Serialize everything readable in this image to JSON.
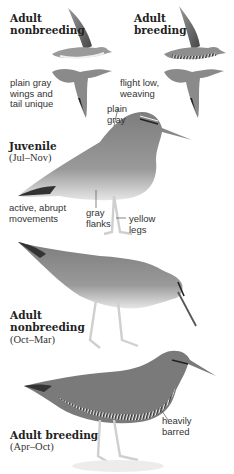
{
  "flight": {
    "nonbreeding": {
      "title_line1": "Adult",
      "title_line2": "nonbreeding",
      "note_line1": "plain gray",
      "note_line2": "wings and",
      "note_line3": "tail unique"
    },
    "breeding": {
      "title_line1": "Adult",
      "title_line2": "breeding",
      "note_line1": "flight low,",
      "note_line2": "weaving"
    }
  },
  "juvenile": {
    "title": "Juvenile",
    "season": "(Jul–Nov)",
    "callout_back_line1": "plain",
    "callout_back_line2": "gray",
    "note_line1": "active, abrupt",
    "note_line2": "movements",
    "callout_flanks_line1": "gray",
    "callout_flanks_line2": "flanks",
    "callout_legs_line1": "yellow",
    "callout_legs_line2": "legs"
  },
  "adult_nonbreeding": {
    "title_line1": "Adult",
    "title_line2": "nonbreeding",
    "season": "(Oct–Mar)"
  },
  "adult_breeding": {
    "title": "Adult breeding",
    "season": "(Apr–Oct)",
    "callout_line1": "heavily",
    "callout_line2": "barred"
  },
  "colors": {
    "plumage": "#8a8a8a",
    "plumage_dark": "#5e5e5e",
    "belly": "#f2f2f2",
    "legs": "#d9d9d9"
  }
}
